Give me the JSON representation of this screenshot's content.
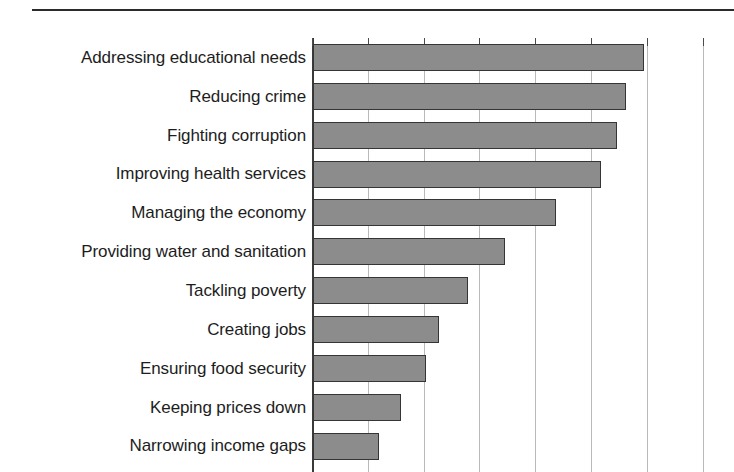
{
  "page": {
    "background_color": "#ffffff",
    "rule_color": "#2b2b2b"
  },
  "chart_data": {
    "type": "bar",
    "orientation": "horizontal",
    "title": "",
    "subtitle": "",
    "xlabel": "",
    "ylabel": "",
    "legend": [],
    "legend_position": "none",
    "grid": true,
    "grid_axis": "x",
    "gridline_count": 8,
    "gridline_spacing_px": 55.8,
    "xlim": [
      0,
      7.5
    ],
    "bar_color": "#8c8c8c",
    "bar_border_color": "#353535",
    "categories": [
      "Addressing educational needs",
      "Reducing crime",
      "Fighting corruption",
      "Improving health services",
      "Managing the economy",
      "Providing water and sanitation",
      "Tackling poverty",
      "Creating jobs",
      "Ensuring food security",
      "Keeping prices down",
      "Narrowing income gaps"
    ],
    "values": [
      5.93,
      5.61,
      5.45,
      5.16,
      4.35,
      3.44,
      2.78,
      2.26,
      2.02,
      1.58,
      1.18
    ],
    "xticklabels": [],
    "note": "x axis tick labels are not rendered in the visible crop; bottom row is clipped by the image edge"
  }
}
